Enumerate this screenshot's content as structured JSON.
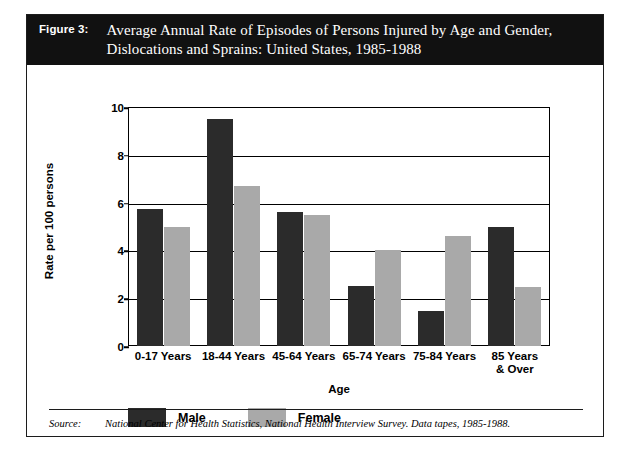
{
  "figure": {
    "label": "Figure 3:",
    "title_line1": "Average Annual Rate of Episodes of Persons Injured by Age and Gender,",
    "title_line2": "Dislocations and Sprains:  United States, 1985-1988"
  },
  "source": {
    "label": "Source:",
    "text": "National Center for Health Statistics, National Health Interview Survey.  Data tapes, 1985-1988."
  },
  "legend": {
    "items": [
      {
        "label": "Male",
        "color": "#2b2b2b"
      },
      {
        "label": "Female",
        "color": "#a9a9a9"
      }
    ]
  },
  "chart_data": {
    "type": "bar",
    "title": "Average Annual Rate of Episodes of Persons Injured by Age and Gender, Dislocations and Sprains:  United States, 1985-1988",
    "xlabel": "Age",
    "ylabel": "Rate per 100 persons",
    "categories": [
      "0-17 Years",
      "18-44 Years",
      "45-64 Years",
      "65-74 Years",
      "75-84 Years",
      "85 Years & Over"
    ],
    "category_lines": [
      [
        "0-17 Years"
      ],
      [
        "18-44 Years"
      ],
      [
        "45-64 Years"
      ],
      [
        "65-74 Years"
      ],
      [
        "75-84 Years"
      ],
      [
        "85 Years",
        "& Over"
      ]
    ],
    "series": [
      {
        "name": "Male",
        "color": "#2b2b2b",
        "values": [
          5.75,
          9.5,
          5.6,
          2.5,
          1.45,
          5.0
        ]
      },
      {
        "name": "Female",
        "color": "#a9a9a9",
        "values": [
          5.0,
          6.7,
          5.5,
          4.0,
          4.6,
          2.45
        ]
      }
    ],
    "ylim": [
      0,
      10
    ],
    "yticks": [
      0,
      2,
      4,
      6,
      8,
      10
    ],
    "ytick_labels": [
      "0",
      "2",
      "4",
      "6",
      "8",
      "10"
    ],
    "grid": true,
    "legend_position": "below-axis-left"
  }
}
